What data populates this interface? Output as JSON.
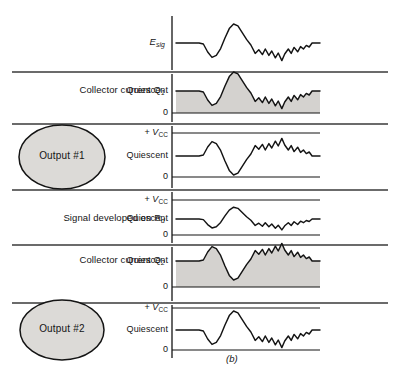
{
  "figure": {
    "caption": "(b)",
    "colors": {
      "trace": "#141414",
      "rule": "#3a3a3a",
      "fill": "#d4d2cf",
      "bubble_fill": "#dcdad7",
      "background": "#ffffff"
    }
  },
  "rows": [
    {
      "id": "input-signal",
      "label": "E",
      "label_sub": "sig",
      "bubble": null,
      "axis_labels": [],
      "baseline_label": null,
      "shaded": false,
      "inverted": false,
      "amplitude": 1.0
    },
    {
      "id": "collector-current-q1",
      "label": "Collector current Q",
      "label_sub": "1",
      "bubble": null,
      "axis_labels": [
        "Quiescent",
        "0"
      ],
      "shaded": true,
      "inverted": false,
      "amplitude": 1.0
    },
    {
      "id": "output-1",
      "label": null,
      "label_sub": null,
      "bubble": "Output #1",
      "axis_labels": [
        "+ V",
        "Quiescent",
        "0"
      ],
      "axis_label_sub": "CC",
      "shaded": false,
      "inverted": true,
      "amplitude": 1.0
    },
    {
      "id": "signal-developed-on-rd",
      "label": "Signal developed on R",
      "label_sub": "d",
      "bubble": null,
      "axis_labels": [
        "+ V",
        "Quiescent",
        "0"
      ],
      "axis_label_sub": "CC",
      "shaded": false,
      "inverted": false,
      "amplitude": 0.62
    },
    {
      "id": "collector-current-q2",
      "label": "Collector current Q",
      "label_sub": "2",
      "bubble": null,
      "axis_labels": [
        "Quiescent",
        "0"
      ],
      "shaded": true,
      "inverted": true,
      "amplitude": 1.0
    },
    {
      "id": "output-2",
      "label": null,
      "label_sub": null,
      "bubble": "Output #2",
      "axis_labels": [
        "+ V",
        "Quiescent",
        "0"
      ],
      "axis_label_sub": "CC",
      "shaded": false,
      "inverted": false,
      "amplitude": 1.0
    }
  ],
  "chart_data": {
    "type": "line",
    "xlabel": "",
    "ylabel": "",
    "grid": false,
    "legend": "none",
    "waveform_shape": "complex speech-like burst: flat quiescent, positive bump, deep negative trough, jagged double positive peak, small negative dip, return to flat",
    "normalized_waveform": [
      [
        0.0,
        0.0
      ],
      [
        0.16,
        0.0
      ],
      [
        0.19,
        -0.05
      ],
      [
        0.22,
        -0.45
      ],
      [
        0.25,
        -0.72
      ],
      [
        0.28,
        -0.62
      ],
      [
        0.31,
        -0.28
      ],
      [
        0.34,
        0.25
      ],
      [
        0.37,
        0.72
      ],
      [
        0.4,
        0.95
      ],
      [
        0.43,
        0.86
      ],
      [
        0.46,
        0.52
      ],
      [
        0.49,
        0.18
      ],
      [
        0.52,
        -0.1
      ],
      [
        0.55,
        -0.52
      ],
      [
        0.575,
        -0.34
      ],
      [
        0.6,
        -0.58
      ],
      [
        0.62,
        -0.3
      ],
      [
        0.645,
        -0.62
      ],
      [
        0.665,
        -0.4
      ],
      [
        0.69,
        -0.74
      ],
      [
        0.71,
        -0.5
      ],
      [
        0.735,
        -0.88
      ],
      [
        0.755,
        -0.55
      ],
      [
        0.78,
        -0.3
      ],
      [
        0.8,
        -0.52
      ],
      [
        0.82,
        -0.22
      ],
      [
        0.845,
        -0.44
      ],
      [
        0.865,
        -0.18
      ],
      [
        0.885,
        -0.3
      ],
      [
        0.905,
        -0.12
      ],
      [
        0.925,
        -0.2
      ],
      [
        0.945,
        0.0
      ],
      [
        1.0,
        0.0
      ]
    ],
    "series": [
      {
        "name": "E_sig",
        "inverted": false,
        "shaded": false,
        "amplitude": 1.0
      },
      {
        "name": "Collector current Q1",
        "inverted": false,
        "shaded": true,
        "amplitude": 1.0
      },
      {
        "name": "Output #1",
        "inverted": true,
        "shaded": false,
        "amplitude": 1.0
      },
      {
        "name": "Signal developed on Rd",
        "inverted": false,
        "shaded": false,
        "amplitude": 0.62
      },
      {
        "name": "Collector current Q2",
        "inverted": true,
        "shaded": true,
        "amplitude": 1.0
      },
      {
        "name": "Output #2",
        "inverted": false,
        "shaded": false,
        "amplitude": 1.0
      }
    ],
    "reference_levels": [
      "+ V_CC",
      "Quiescent",
      "0"
    ]
  }
}
